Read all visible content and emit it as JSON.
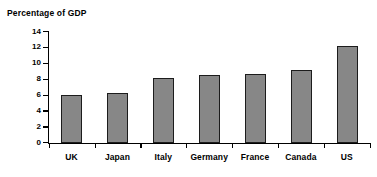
{
  "chart_data": {
    "type": "bar",
    "title": "Percentage of GDP",
    "xlabel": "",
    "ylabel": "",
    "ylim": [
      0,
      14
    ],
    "yticks": [
      0,
      2,
      4,
      6,
      8,
      10,
      12,
      14
    ],
    "grid": false,
    "legend": null,
    "categories": [
      "UK",
      "Japan",
      "Italy",
      "Germany",
      "France",
      "Canada",
      "US"
    ],
    "values": [
      6.1,
      6.3,
      8.2,
      8.6,
      8.7,
      9.2,
      12.3
    ],
    "bar_color": "#878787",
    "bar_border_color": "#1c1c1c",
    "background_color": "#ffffff"
  }
}
